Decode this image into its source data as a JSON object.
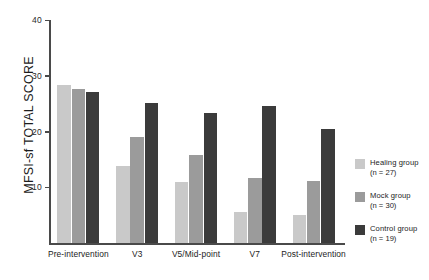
{
  "chart_data": {
    "type": "bar",
    "title": "",
    "xlabel": "",
    "ylabel": "MFSI-sf TOTAL SCORE",
    "ylim": [
      0,
      40
    ],
    "yticks": [
      0,
      10,
      20,
      30,
      40
    ],
    "ytick_labels": [
      "0",
      "10",
      "20",
      "30",
      "40"
    ],
    "grid": false,
    "legend_position": "right",
    "categories": [
      "Pre-intervention",
      "V3",
      "V5/Mid-point",
      "V7",
      "Post-intervention"
    ],
    "series": [
      {
        "name": "Healing group",
        "count_label": "(n = 27)",
        "color": "#c9c9c9",
        "values": [
          28.3,
          13.8,
          11.0,
          5.5,
          5.0
        ]
      },
      {
        "name": "Mock group",
        "color": "#9b9b9b",
        "count_label": "(n = 30)",
        "values": [
          27.6,
          19.1,
          15.8,
          11.7,
          11.2
        ]
      },
      {
        "name": "Control group",
        "color": "#3b3b3b",
        "count_label": "(n = 19)",
        "values": [
          27.0,
          25.2,
          23.4,
          24.5,
          20.5
        ]
      }
    ]
  },
  "legend": {
    "items": [
      {
        "label": "Healing group",
        "count": "(n = 27)",
        "color": "#c9c9c9"
      },
      {
        "label": "Mock group",
        "count": "(n = 30)",
        "color": "#9b9b9b"
      },
      {
        "label": "Control group",
        "count": "(n = 19)",
        "color": "#3b3b3b"
      }
    ]
  }
}
